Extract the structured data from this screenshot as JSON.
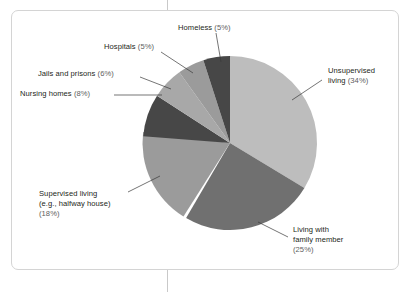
{
  "chart_data": {
    "type": "pie",
    "title": "",
    "subtitle": "",
    "xlabel": "",
    "ylabel": "",
    "legend_position": "callout-labels",
    "grid": false,
    "categories": [
      "Unsupervised living",
      "Living with family member",
      "Supervised living (e.g., halfway house)",
      "Nursing homes",
      "Jails and prisons",
      "Hospitals",
      "Homeless"
    ],
    "values": [
      34,
      25,
      18,
      8,
      6,
      5,
      5
    ],
    "units": "%",
    "slices": [
      {
        "name": "Unsupervised living",
        "value": 34,
        "pct_text": "(34%)",
        "color": "#bdbdbd",
        "start_angle_deg": 0,
        "end_angle_deg": 122.4
      },
      {
        "name": "Living with family member",
        "value": 25,
        "pct_text": "(25%)",
        "color": "#707070",
        "start_angle_deg": 122.4,
        "end_angle_deg": 212.4
      },
      {
        "name": "Supervised living (e.g., halfway house)",
        "value": 18,
        "pct_text": "(18%)",
        "color": "#9b9b9b",
        "start_angle_deg": 212.4,
        "end_angle_deg": 277.2
      },
      {
        "name": "Nursing homes",
        "value": 8,
        "pct_text": "(8%)",
        "color": "#474747",
        "start_angle_deg": 277.2,
        "end_angle_deg": 306.0
      },
      {
        "name": "Jails and prisons",
        "value": 6,
        "pct_text": "(6%)",
        "color": "#a8a8a8",
        "start_angle_deg": 306.0,
        "end_angle_deg": 327.6
      },
      {
        "name": "Hospitals",
        "value": 5,
        "pct_text": "(5%)",
        "color": "#9b9b9b",
        "start_angle_deg": 327.6,
        "end_angle_deg": 345.6
      },
      {
        "name": "Homeless",
        "value": 5,
        "pct_text": "(5%)",
        "color": "#474747",
        "start_angle_deg": 345.6,
        "end_angle_deg": 360.0
      }
    ]
  },
  "labels": {
    "homeless": {
      "line1": "Homeless ",
      "pct": "(5%)"
    },
    "hospitals": {
      "line1": "Hospitals ",
      "pct": "(5%)"
    },
    "jails": {
      "line1": "Jails and prisons ",
      "pct": "(6%)"
    },
    "nursing": {
      "line1": "Nursing homes ",
      "pct": "(8%)"
    },
    "supervised": {
      "line1": "Supervised living",
      "line2": "(e.g., halfway house)",
      "pct": "(18%)"
    },
    "unsupervised": {
      "line1": "Unsupervised",
      "line2": "living ",
      "pct": "(34%)"
    },
    "family": {
      "line1": "Living with",
      "line2": "family member",
      "pct": "(25%)"
    }
  },
  "colors": {
    "frame_border": "#d4d4d4",
    "vertical_rule": "#c9c9c9",
    "leader_line": "#3a3a3a",
    "text": "#231f20",
    "pct_text": "#5e5e5e",
    "background": "#ffffff"
  }
}
